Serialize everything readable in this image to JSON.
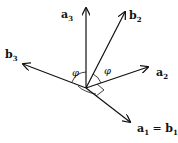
{
  "diagram": {
    "title": "",
    "origin": [
      86,
      88
    ],
    "vectors": [
      {
        "id": "a3",
        "base": "a",
        "sub": "3",
        "end": [
          86,
          7
        ],
        "label_pos": [
          61,
          18
        ]
      },
      {
        "id": "b2",
        "base": "b",
        "sub": "2",
        "end": [
          126,
          11
        ],
        "label_pos": [
          130,
          20
        ]
      },
      {
        "id": "b3",
        "base": "b",
        "sub": "3",
        "end": [
          22,
          64
        ],
        "label_pos": [
          5,
          58
        ]
      },
      {
        "id": "a2",
        "base": "a",
        "sub": "2",
        "end": [
          149,
          67
        ],
        "label_pos": [
          156,
          76
        ]
      },
      {
        "id": "a1_b1",
        "base": "a",
        "sub": "1",
        "end": [
          131,
          123
        ],
        "label_pos": [
          137,
          132
        ],
        "equals_base": "b",
        "equals_sub": "1"
      }
    ],
    "angles": [
      {
        "symbol": "φ",
        "label_pos": [
          72,
          75
        ]
      },
      {
        "symbol": "φ",
        "label_pos": [
          104,
          72
        ]
      }
    ],
    "colors": {
      "stroke": "#111111",
      "background": "#ffffff"
    }
  }
}
